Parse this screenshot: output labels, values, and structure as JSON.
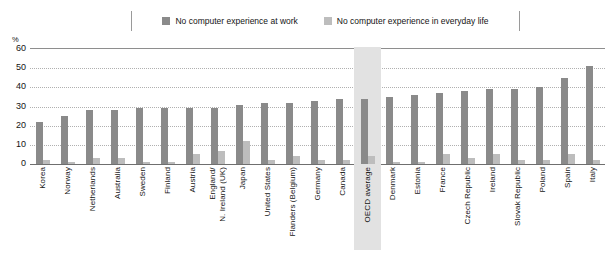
{
  "chart_data": {
    "type": "bar",
    "title": "",
    "subtitle": "",
    "xlabel": "",
    "ylabel": "%",
    "ylim": [
      0,
      60
    ],
    "yticks": [
      60,
      50,
      40,
      30,
      20,
      10,
      0
    ],
    "grid": true,
    "legend_position": "top-center",
    "highlight_category": "OECD average",
    "colors": {
      "work": "#8a8a8a",
      "life": "#bdbdbd",
      "highlight_band": "#e2e2e2",
      "gridline": "#b0b0b0",
      "axis": "#6f6f6f"
    },
    "categories": [
      "Korea",
      "Norway",
      "Netherlands",
      "Australia",
      "Sweden",
      "Finland",
      "Austria",
      "England/\nN. Ireland (UK)",
      "Japan",
      "United States",
      "Flanders (Belgium)",
      "Germany",
      "Canada",
      "OECD average",
      "Denmark",
      "Estonia",
      "France",
      "Czech Republic",
      "Ireland",
      "Slovak Republic",
      "Poland",
      "Spain",
      "Italy"
    ],
    "series": [
      {
        "name": "No computer experience at work",
        "color": "#8a8a8a",
        "values": [
          22,
          25,
          28,
          28,
          29,
          29,
          29,
          29,
          31,
          32,
          32,
          33,
          34,
          34,
          35,
          36,
          37,
          38,
          39,
          39,
          40,
          45,
          51
        ]
      },
      {
        "name": "No computer experience in everyday life",
        "color": "#bdbdbd",
        "values": [
          2,
          1,
          3,
          3,
          1,
          1,
          5,
          7,
          12,
          2,
          4,
          2,
          2,
          4,
          1,
          1,
          5,
          3,
          5,
          2,
          2,
          5,
          2
        ]
      }
    ]
  },
  "legend": {
    "entries": [
      {
        "label": "No computer experience at work",
        "swatch": "#8a8a8a"
      },
      {
        "label": "No computer experience in everyday life",
        "swatch": "#bdbdbd"
      }
    ]
  },
  "axis": {
    "percent_symbol": "%",
    "y_tick_labels": [
      "60",
      "50",
      "40",
      "30",
      "20",
      "10",
      "0"
    ]
  }
}
